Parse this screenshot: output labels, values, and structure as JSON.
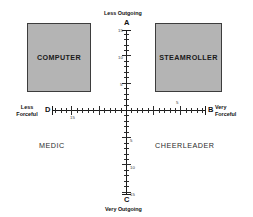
{
  "diagram": {
    "colors": {
      "box_fill": "#b4b4b4",
      "box_border": "#3d3d3d",
      "axis": "#1a1a1a",
      "background": "#ffffff"
    },
    "axes": {
      "vertical": {
        "top_caption": "Less Outgoing",
        "bottom_caption": "Very Outgoing",
        "top_pole": "A",
        "bottom_pole": "C",
        "tick_labels_up": [
          "15",
          "10",
          "5"
        ],
        "tick_labels_down": [
          "5",
          "10",
          "15"
        ]
      },
      "horizontal": {
        "left_caption_line1": "Less",
        "left_caption_line2": "Forceful",
        "right_caption_line1": "Very",
        "right_caption_line2": "Forceful",
        "left_pole": "D",
        "right_pole": "B",
        "left_tick_label": "15",
        "right_tick_label": "5"
      }
    },
    "quadrants": {
      "top_left": {
        "label": "COMPUTER",
        "style": "box"
      },
      "top_right": {
        "label": "STEAMROLLER",
        "style": "box"
      },
      "bottom_left": {
        "label": "MEDIC",
        "style": "text"
      },
      "bottom_right": {
        "label": "CHEERLEADER",
        "style": "text"
      }
    }
  },
  "chart_data": {
    "type": "scatter",
    "xlabel": "Forcefulness",
    "ylabel": "Outgoingness",
    "xlim": [
      -15,
      15
    ],
    "ylim": [
      -15,
      15
    ],
    "grid": false,
    "legend": "none",
    "x_axis_poles": {
      "left": "D",
      "right": "B"
    },
    "y_axis_poles": {
      "top": "A",
      "bottom": "C"
    },
    "x_tick_labels": [
      "15",
      "5"
    ],
    "y_tick_labels": [
      "15",
      "10",
      "5",
      "5",
      "10",
      "15"
    ],
    "annotations": [
      {
        "text": "COMPUTER",
        "quadrant": "top-left"
      },
      {
        "text": "STEAMROLLER",
        "quadrant": "top-right"
      },
      {
        "text": "MEDIC",
        "quadrant": "bottom-left"
      },
      {
        "text": "CHEERLEADER",
        "quadrant": "bottom-right"
      },
      {
        "text": "Less Outgoing",
        "position": "top"
      },
      {
        "text": "Very Outgoing",
        "position": "bottom"
      },
      {
        "text": "Less Forceful",
        "position": "left"
      },
      {
        "text": "Very Forceful",
        "position": "right"
      }
    ]
  }
}
